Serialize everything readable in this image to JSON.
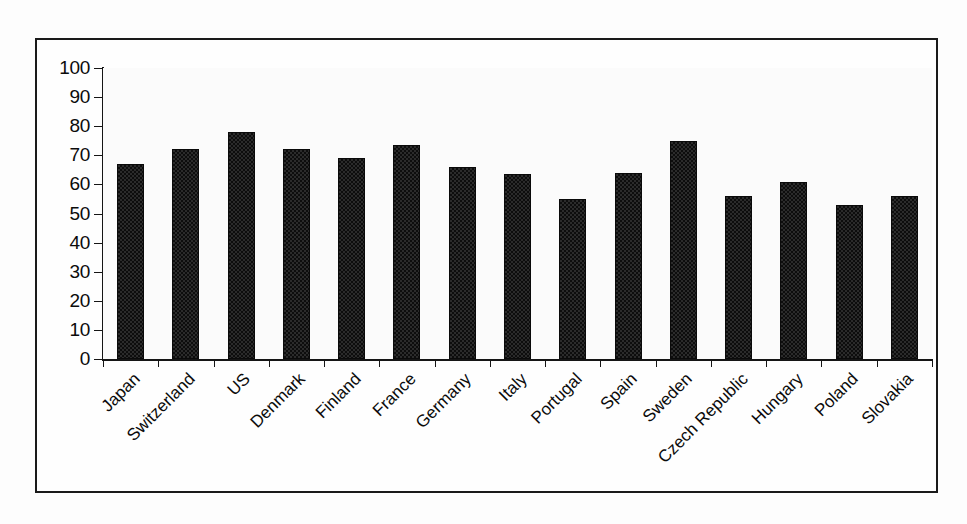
{
  "chart_data": {
    "type": "bar",
    "title": "",
    "subtitle": "",
    "xlabel": "",
    "ylabel": "",
    "ylim": [
      0,
      100
    ],
    "ytick_step": 10,
    "yticks": [
      100,
      90,
      80,
      70,
      60,
      50,
      40,
      30,
      20,
      10,
      0
    ],
    "grid": true,
    "legend": false,
    "legend_position": "none",
    "xtick_label_rotation": -45,
    "categories": [
      "Japan",
      "Switzerland",
      "US",
      "Denmark",
      "Finland",
      "France",
      "Germany",
      "Italy",
      "Portugal",
      "Spain",
      "Sweden",
      "Czech Republic",
      "Hungary",
      "Poland",
      "Slovakia"
    ],
    "values": [
      67,
      72,
      78,
      72,
      69,
      73.5,
      66,
      63.5,
      55,
      64,
      75,
      56,
      61,
      53,
      56
    ],
    "series": [
      {
        "name": "",
        "values": [
          67,
          72,
          78,
          72,
          69,
          73.5,
          66,
          63.5,
          55,
          64,
          75,
          56,
          61,
          53,
          56
        ]
      }
    ]
  },
  "colors": {
    "bar_fill": "#2b2b2b",
    "bar_pattern": "#0d0d0d",
    "bar_border": "#0a0a0a",
    "axis": "#151515",
    "gridline": "#222222",
    "frame": "#1a1a1a",
    "plot_background": "#fbfbfb",
    "page_background": "#fdfdfd",
    "text": "#0b0b0b"
  }
}
